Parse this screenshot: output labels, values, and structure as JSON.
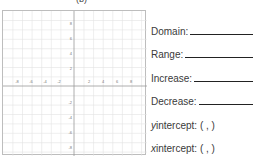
{
  "worksheet": {
    "top_label": "(b)",
    "graph": {
      "x_ticks": [
        "-8",
        "-6",
        "-4",
        "-2",
        "2",
        "4",
        "6",
        "8"
      ],
      "y_ticks": [
        "8",
        "6",
        "4",
        "2",
        "-2",
        "-4",
        "-6",
        "-8"
      ],
      "grid_color": "#dcdcdc",
      "axis_color": "#9a9a9a"
    },
    "fields": [
      {
        "label": "Domain:",
        "blank": true
      },
      {
        "label": "Range:",
        "blank": true
      },
      {
        "label": "Increase:",
        "blank": true
      },
      {
        "label": "Decrease:",
        "blank": true
      },
      {
        "var": "y",
        "label": " intercept: ( , )",
        "blank": false
      },
      {
        "var": "x",
        "label": " intercept: ( , )",
        "blank": false
      }
    ]
  }
}
